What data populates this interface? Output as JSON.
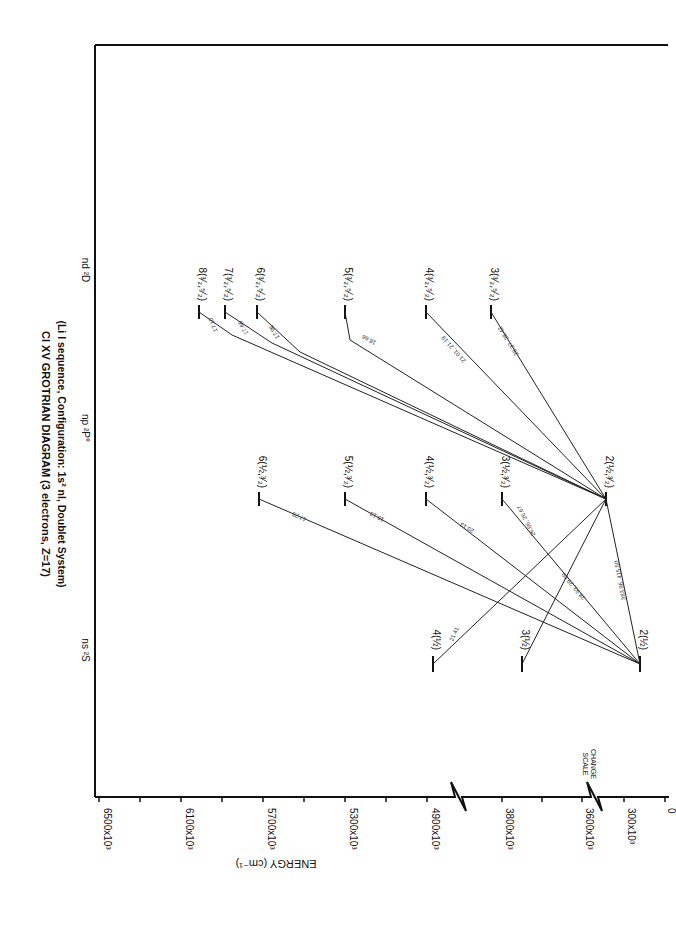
{
  "title": {
    "line1": "Cl XV GROTRIAN DIAGRAM (3 electrons, Z=17)",
    "line2": "(Li I sequence, Configuration: 1s² nl,     Doublet System)"
  },
  "series_headers": {
    "s": "ns ²S",
    "p": "np ²P°",
    "d": "nd ²D"
  },
  "axis": {
    "label": "ENERGY (cm⁻¹)",
    "ticks": [
      "6500x10³",
      "6100x10³",
      "5700x10³",
      "5300x10³",
      "4900x10³",
      "3800x10³",
      "3600x10³",
      "300x10³",
      "0"
    ],
    "scale_change_label_1": "SCALE",
    "scale_change_label_2": "CHANGE"
  },
  "levels": {
    "s": [
      "2(½)",
      "3(½)",
      "4(½)"
    ],
    "p": [
      "2(½,³⁄₂)",
      "3(½,³⁄₂)",
      "4(½,³⁄₂)",
      "5(½,³⁄₂)",
      "6(½,³⁄₂)"
    ],
    "d": [
      "3(³⁄₂,⁵⁄₂)",
      "4(³⁄₂,⁵⁄₂)",
      "5(³⁄₂,⁵⁄₂)",
      "6(³⁄₂,⁵⁄₂)",
      "7(³⁄₂,⁵⁄₂)",
      "8(³⁄₂,⁵⁄₂)"
    ]
  },
  "transitions": {
    "t_2s_2p": "383.96, 415.50",
    "t_2s_3p": "28.93, 29.09",
    "t_2s_4p": "20.13",
    "t_2s_5p": "18.13",
    "t_2s_6p": "17.25",
    "t_2p_3s": "26.66, 26.67",
    "t_2p_4s": "21.41",
    "t_2p_3d": "28.37, 28.42",
    "t_2p_4d": "21.01, 21.19",
    "t_2p_5d": "18.66",
    "t_2p_6d": "17.96",
    "t_2p_7d": "17.46",
    "t_2p_8d": "17.10"
  }
}
